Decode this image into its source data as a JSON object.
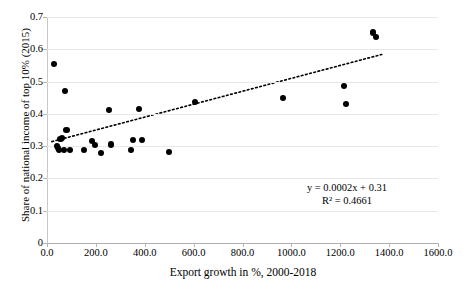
{
  "chart_data": {
    "type": "scatter",
    "title": "",
    "xlabel": "Export growth in %, 2000-2018",
    "ylabel": "Share of national income of top 10% (2015)",
    "xlim": [
      0,
      1600
    ],
    "ylim": [
      0,
      0.7
    ],
    "xticks": [
      "0.0",
      "200.0",
      "400.0",
      "600.0",
      "800.0",
      "1000.0",
      "1200.0",
      "1400.0",
      "1600.0"
    ],
    "xtick_values": [
      0,
      200,
      400,
      600,
      800,
      1000,
      1200,
      1400,
      1600
    ],
    "yticks": [
      "0",
      "0.1",
      "0.2",
      "0.3",
      "0.4",
      "0.5",
      "0.6",
      "0.7"
    ],
    "ytick_values": [
      0,
      0.1,
      0.2,
      0.3,
      0.4,
      0.5,
      0.6,
      0.7
    ],
    "grid": "horizontal",
    "legend": "none",
    "marker_color": "#000000",
    "gridline_color": "#e8e8e8",
    "points": [
      {
        "x": 30,
        "y": 0.555
      },
      {
        "x": 40,
        "y": 0.3
      },
      {
        "x": 45,
        "y": 0.293
      },
      {
        "x": 50,
        "y": 0.289
      },
      {
        "x": 55,
        "y": 0.322
      },
      {
        "x": 62,
        "y": 0.326
      },
      {
        "x": 70,
        "y": 0.287
      },
      {
        "x": 75,
        "y": 0.47
      },
      {
        "x": 80,
        "y": 0.35
      },
      {
        "x": 95,
        "y": 0.288
      },
      {
        "x": 150,
        "y": 0.288
      },
      {
        "x": 185,
        "y": 0.315
      },
      {
        "x": 195,
        "y": 0.303
      },
      {
        "x": 220,
        "y": 0.279
      },
      {
        "x": 255,
        "y": 0.413
      },
      {
        "x": 262,
        "y": 0.305
      },
      {
        "x": 345,
        "y": 0.288
      },
      {
        "x": 352,
        "y": 0.318
      },
      {
        "x": 375,
        "y": 0.415
      },
      {
        "x": 390,
        "y": 0.32
      },
      {
        "x": 500,
        "y": 0.281
      },
      {
        "x": 605,
        "y": 0.437
      },
      {
        "x": 965,
        "y": 0.45
      },
      {
        "x": 1215,
        "y": 0.487
      },
      {
        "x": 1225,
        "y": 0.43
      },
      {
        "x": 1335,
        "y": 0.652
      },
      {
        "x": 1345,
        "y": 0.638
      }
    ],
    "trendline": {
      "equation": "y = 0.0002x + 0.31",
      "r_squared_label": "R² = 0.4661",
      "r_squared": 0.4661,
      "slope": 0.0002,
      "intercept": 0.31,
      "style": "dotted",
      "color": "#000000",
      "x_start": 20,
      "x_end": 1370
    }
  }
}
